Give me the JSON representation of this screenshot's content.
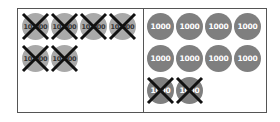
{
  "diagram": {
    "type": "place-value-chips",
    "left_panel": {
      "chip_label": "10,000",
      "chip_count": 6,
      "crossed_out": 6,
      "chips": [
        {
          "label": "10,000",
          "crossed": true
        },
        {
          "label": "10,000",
          "crossed": true
        },
        {
          "label": "10,000",
          "crossed": true
        },
        {
          "label": "10,000",
          "crossed": true
        },
        {
          "label": "10,000",
          "crossed": true
        },
        {
          "label": "10,000",
          "crossed": true
        }
      ]
    },
    "right_panel": {
      "chip_label": "1000",
      "chip_count": 10,
      "crossed_out": 2,
      "chips": [
        {
          "label": "1000",
          "crossed": false
        },
        {
          "label": "1000",
          "crossed": false
        },
        {
          "label": "1000",
          "crossed": false
        },
        {
          "label": "1000",
          "crossed": false
        },
        {
          "label": "1000",
          "crossed": false
        },
        {
          "label": "1000",
          "crossed": false
        },
        {
          "label": "1000",
          "crossed": false
        },
        {
          "label": "1000",
          "crossed": false
        },
        {
          "label": "1000",
          "crossed": true
        },
        {
          "label": "1000",
          "crossed": true
        }
      ]
    },
    "colors": {
      "tenk_chip": "#a9a9a9",
      "thou_chip": "#7f7f7f",
      "cross": "#111111",
      "border": "#555555"
    }
  }
}
